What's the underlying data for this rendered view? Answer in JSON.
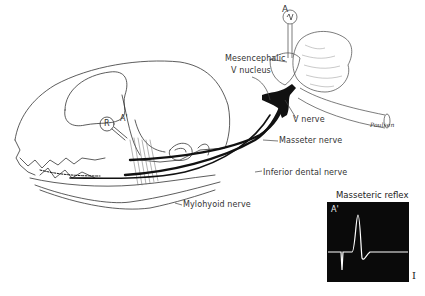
{
  "figure": {
    "type": "anatomical-diagram",
    "labels": {
      "electrode_a": "A",
      "electrode_a_prime": "A'",
      "stimulus_r": "R",
      "mesencephalic": "Mesencephalic",
      "v_nucleus": "V nucleus",
      "v_nerve": "V nerve",
      "masseter_nerve": "Masseter nerve",
      "inferior_dental_nerve": "Inferior dental nerve",
      "mylohyoid_nerve": "Mylohyoid nerve",
      "brainstem_signature": "Poulsen"
    },
    "inset": {
      "title": "Masseteric reflex",
      "channel_label": "A'",
      "scale_bar": "I",
      "background_color": "#0a0a0a",
      "trace_color": "#ffffff"
    }
  }
}
